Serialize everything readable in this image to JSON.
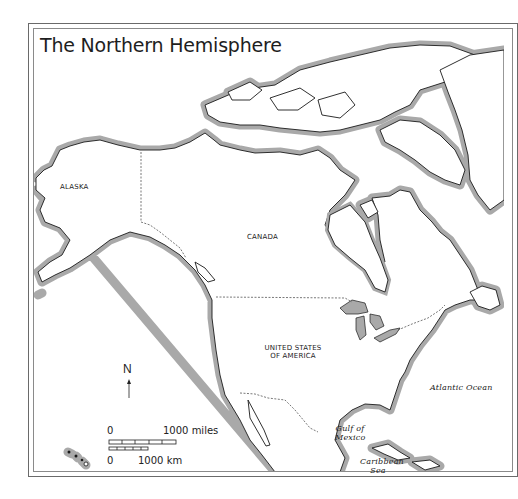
{
  "map": {
    "title": "The Northern Hemisphere",
    "labels": {
      "alaska": "ALASKA",
      "canada": "CANADA",
      "usa_line1": "UNITED STATES",
      "usa_line2": "OF AMERICA",
      "atlantic": "Atlantic Ocean",
      "gulf_line1": "Gulf of",
      "gulf_line2": "Mexico",
      "caribbean_line1": "Caribbean",
      "caribbean_line2": "Sea"
    },
    "compass": {
      "label": "N",
      "icon": "north-arrow-icon"
    },
    "scale": {
      "miles_start": "0",
      "miles_end": "1000 miles",
      "km_start": "0",
      "km_end": "1000 km"
    },
    "colors": {
      "land": "#ffffff",
      "coastline": "#1a1a1a",
      "coast_halo": "#a9a9a9",
      "border": "#555555",
      "frame": "#6a6a6a"
    }
  }
}
